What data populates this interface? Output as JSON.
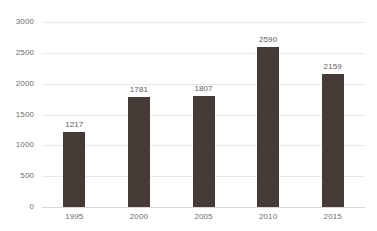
{
  "chart_data": {
    "type": "bar",
    "title": "",
    "xlabel": "",
    "ylabel": "",
    "categories": [
      "1995",
      "2000",
      "2005",
      "2010",
      "2015"
    ],
    "values": [
      1217,
      1781,
      1807,
      2590,
      2159
    ],
    "value_labels": [
      "1217",
      "1781",
      "1807",
      "2590",
      "2159"
    ],
    "ylim": [
      0,
      3000
    ],
    "yticks": [
      3000,
      2500,
      2000,
      1500,
      1000,
      500,
      0
    ],
    "ytick_labels": [
      "3000",
      "2500",
      "2000",
      "1500",
      "1000",
      "500",
      "0"
    ],
    "grid": true,
    "legend": null,
    "series": [
      {
        "name": "Series 1",
        "values": [
          1217,
          1781,
          1807,
          2590,
          2159
        ],
        "color": "#453a35"
      }
    ]
  },
  "style": {
    "bar_color": "#453a35",
    "grid_color": "#e9e9e9",
    "axis_color": "#d9d9d9",
    "label_color": "#6e6e6e",
    "value_label_color": "#5c5c5c",
    "background": "#ffffff"
  },
  "cropped_title": {
    "text": ""
  }
}
